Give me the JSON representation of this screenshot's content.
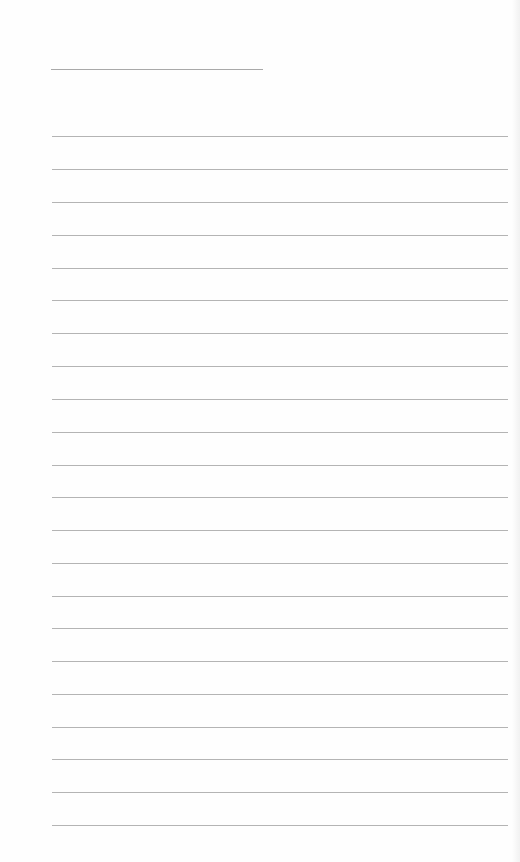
{
  "document": {
    "type": "lined-paper",
    "title_line": {
      "x": 51,
      "y": 69,
      "width": 212
    },
    "ruled_lines": {
      "count": 22,
      "left": 52,
      "width": 456,
      "positions": [
        136,
        169,
        202,
        235,
        268,
        300,
        333,
        366,
        399,
        432,
        465,
        497,
        530,
        563,
        596,
        628,
        661,
        694,
        727,
        759,
        792,
        825
      ]
    },
    "colors": {
      "paper": "#fefefe",
      "line": "#b4b4b4",
      "title_line": "#a9a9a9"
    }
  }
}
